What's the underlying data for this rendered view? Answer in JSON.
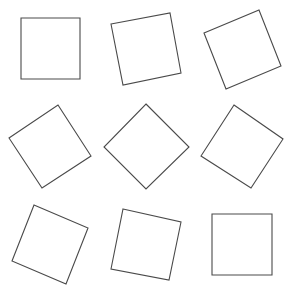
{
  "canvas": {
    "width": 290,
    "height": 291,
    "background": "#ffffff",
    "stroke": "#4a4a4a"
  },
  "squares": [
    {
      "label": "square-1",
      "points": "21,18 80,18 80,79 21,79"
    },
    {
      "label": "square-2",
      "points": "111,24 170,13 181,73 123,85"
    },
    {
      "label": "square-3",
      "points": "204,33 259,10 281,66 226,89"
    },
    {
      "label": "square-4",
      "points": "9,138 58,105 91,156 42,188"
    },
    {
      "label": "square-5",
      "points": "146,104 189,147 146,189 104,147"
    },
    {
      "label": "square-6",
      "points": "234,105 283,139 251,188 201,156"
    },
    {
      "label": "square-7",
      "points": "34,205 88,228 66,284 12,261"
    },
    {
      "label": "square-8",
      "points": "123,209 181,222 169,280 111,269"
    },
    {
      "label": "square-9",
      "points": "212,214 272,214 272,275 212,275"
    }
  ]
}
